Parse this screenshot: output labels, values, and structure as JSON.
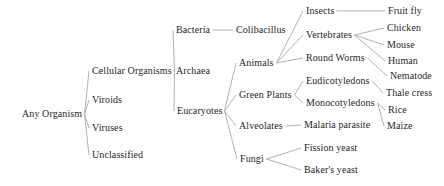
{
  "diagram": {
    "colors": {
      "background": "#ffffff",
      "line": "#b3b3b3",
      "text": "#1f1f1f"
    },
    "tree": {
      "label": "Any Organism",
      "children": [
        {
          "label": "Cellular Organisms",
          "children": [
            {
              "label": "Bacteria",
              "children": [
                {
                  "label": "Colibacillus"
                }
              ]
            },
            {
              "label": "Archaea"
            },
            {
              "label": "Eucaryotes",
              "children": [
                {
                  "label": "Animals",
                  "children": [
                    {
                      "label": "Insects",
                      "children": [
                        {
                          "label": "Fruit fly"
                        }
                      ]
                    },
                    {
                      "label": "Vertebrates",
                      "children": [
                        {
                          "label": "Chicken"
                        },
                        {
                          "label": "Mouse"
                        },
                        {
                          "label": "Human"
                        }
                      ]
                    },
                    {
                      "label": "Round Worms",
                      "children": [
                        {
                          "label": "Nematode"
                        }
                      ]
                    }
                  ]
                },
                {
                  "label": "Green Plants",
                  "children": [
                    {
                      "label": "Eudicotyledons",
                      "children": [
                        {
                          "label": "Thale cress"
                        }
                      ]
                    },
                    {
                      "label": "Monocotyledons",
                      "children": [
                        {
                          "label": "Rice"
                        },
                        {
                          "label": "Maize"
                        }
                      ]
                    }
                  ]
                },
                {
                  "label": "Alveolates",
                  "children": [
                    {
                      "label": "Malaria parasite"
                    }
                  ]
                },
                {
                  "label": "Fungi",
                  "children": [
                    {
                      "label": "Fission yeast"
                    },
                    {
                      "label": "Baker's yeast"
                    }
                  ]
                }
              ]
            }
          ]
        },
        {
          "label": "Viroids"
        },
        {
          "label": "Viruses"
        },
        {
          "label": "Unclassified"
        }
      ]
    }
  }
}
